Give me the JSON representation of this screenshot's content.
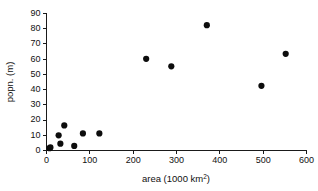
{
  "chart_data": {
    "type": "scatter",
    "title": "",
    "xlabel": "area (1000 km2)",
    "xlabel_base": "area (1000 km",
    "xlabel_sup": "2",
    "xlabel_tail": ")",
    "ylabel": "popn. (m)",
    "xlim": [
      0,
      600
    ],
    "ylim": [
      0,
      90
    ],
    "xticks": [
      0,
      100,
      200,
      300,
      400,
      500,
      600
    ],
    "yticks": [
      0,
      10,
      20,
      30,
      40,
      50,
      60,
      70,
      80,
      90
    ],
    "xtick_labels": [
      "0",
      "100",
      "200",
      "300",
      "400",
      "500",
      "600"
    ],
    "ytick_labels": [
      "0",
      "10",
      "20",
      "30",
      "40",
      "50",
      "60",
      "70",
      "80",
      "90"
    ],
    "grid": false,
    "legend": null,
    "marker": "filled-circle",
    "marker_color": "#0d0d0d",
    "marker_size_px": 5,
    "x": [
      7,
      9,
      28,
      32,
      41,
      64,
      66,
      84,
      122,
      230,
      288,
      370,
      496,
      552
    ],
    "y": [
      1.5,
      2.0,
      10.0,
      4.5,
      16.5,
      3.0,
      3.2,
      11.2,
      11.2,
      60.2,
      55.3,
      82.3,
      42.5,
      63.5
    ],
    "points": [
      {
        "x": 7,
        "y": 1.5
      },
      {
        "x": 9,
        "y": 2.0
      },
      {
        "x": 28,
        "y": 10.0
      },
      {
        "x": 32,
        "y": 4.5
      },
      {
        "x": 41,
        "y": 16.5
      },
      {
        "x": 64,
        "y": 3.0
      },
      {
        "x": 84,
        "y": 11.2
      },
      {
        "x": 122,
        "y": 11.2
      },
      {
        "x": 230,
        "y": 60.2
      },
      {
        "x": 288,
        "y": 55.3
      },
      {
        "x": 370,
        "y": 82.3
      },
      {
        "x": 496,
        "y": 42.5
      },
      {
        "x": 552,
        "y": 63.5
      }
    ]
  },
  "axes": {
    "x_title_base": "area (1000 km",
    "x_title_sup": "2",
    "x_title_tail": ")",
    "y_title": "popn. (m)"
  }
}
